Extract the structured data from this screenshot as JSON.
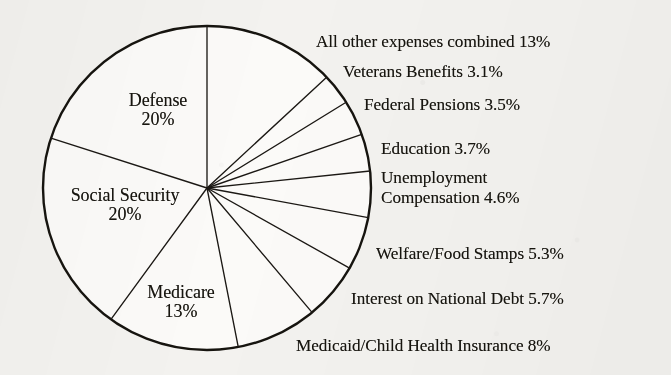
{
  "chart_data": {
    "type": "pie",
    "title": "",
    "subtitle": "",
    "xlabel": "",
    "ylabel": "",
    "legend_position": "none",
    "grid": false,
    "units": "percent of federal budget",
    "start_angle_deg": 0,
    "direction": "clockwise",
    "total_percent": 100,
    "categories": [
      "All other expenses combined",
      "Veterans Benefits",
      "Federal Pensions",
      "Education",
      "Unemployment Compensation",
      "Welfare/Food Stamps",
      "Interest on National Debt",
      "Medicaid/Child Health Insurance",
      "Medicare",
      "Social Security",
      "Defense"
    ],
    "values": [
      13,
      3.1,
      3.5,
      3.7,
      4.6,
      5.3,
      5.7,
      8,
      13,
      20,
      20
    ],
    "slices": [
      {
        "name": "All other expenses combined",
        "value": 13,
        "label": "All other expenses combined 13%",
        "percent_text": "13%",
        "placement": "outside"
      },
      {
        "name": "Veterans Benefits",
        "value": 3.1,
        "label": "Veterans Benefits 3.1%",
        "percent_text": "3.1%",
        "placement": "outside"
      },
      {
        "name": "Federal Pensions",
        "value": 3.5,
        "label": "Federal Pensions 3.5%",
        "percent_text": "3.5%",
        "placement": "outside"
      },
      {
        "name": "Education",
        "value": 3.7,
        "label": "Education 3.7%",
        "percent_text": "3.7%",
        "placement": "outside"
      },
      {
        "name": "Unemployment Compensation",
        "value": 4.6,
        "label": "Unemployment Compensation 4.6%",
        "label_line1": "Unemployment",
        "label_line2": "Compensation 4.6%",
        "percent_text": "4.6%",
        "placement": "outside"
      },
      {
        "name": "Welfare/Food Stamps",
        "value": 5.3,
        "label": "Welfare/Food Stamps 5.3%",
        "percent_text": "5.3%",
        "placement": "outside"
      },
      {
        "name": "Interest on National Debt",
        "value": 5.7,
        "label": "Interest on National Debt 5.7%",
        "percent_text": "5.7%",
        "placement": "outside"
      },
      {
        "name": "Medicaid/Child Health Insurance",
        "value": 8,
        "label": "Medicaid/Child Health Insurance 8%",
        "percent_text": "8%",
        "placement": "outside"
      },
      {
        "name": "Medicare",
        "value": 13,
        "label": "Medicare",
        "percent_text": "13%",
        "placement": "inside"
      },
      {
        "name": "Social Security",
        "value": 20,
        "label": "Social Security",
        "percent_text": "20%",
        "placement": "inside"
      },
      {
        "name": "Defense",
        "value": 20,
        "label": "Defense",
        "percent_text": "20%",
        "placement": "inside"
      }
    ],
    "colors": {
      "slice_fill": "#fbfaf8",
      "outline": "#16140f",
      "divider": "#1b1814",
      "text": "#17150f",
      "background": "#f3f2ef"
    }
  }
}
